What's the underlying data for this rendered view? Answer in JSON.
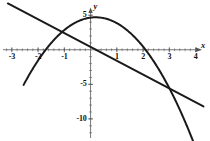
{
  "figure": {
    "kind": "cartesian-plot",
    "background": "#ffffff",
    "stroke_color": "#1a1a1a",
    "axis_color": "#555555"
  },
  "axes": {
    "x_name": "x",
    "y_name": "y",
    "x_range": [
      -3.45,
      4.55
    ],
    "y_range": [
      -13.2,
      7.2
    ],
    "x_major_ticks": [
      -3,
      -2,
      -1,
      1,
      2,
      3,
      4
    ],
    "x_major_labels": [
      "-3",
      "-2",
      "-1",
      "1",
      "2",
      "3",
      "4"
    ],
    "y_major_ticks": [
      5,
      -5,
      -10
    ],
    "y_major_labels": [
      "5",
      "-5",
      "-10"
    ],
    "x_minor_step": 0.2,
    "y_minor_step": 1,
    "grid": false,
    "arrows": [
      "x-right",
      "y-up"
    ]
  },
  "chart_data": {
    "type": "line",
    "title": "",
    "xlabel": "x",
    "ylabel": "y",
    "xlim": [
      -3.45,
      4.55
    ],
    "ylim": [
      -13.2,
      7.2
    ],
    "grid": false,
    "legend": "none",
    "series": [
      {
        "name": "parabola",
        "kind": "quadratic",
        "equation": "y = -1.3x^2 + 0.5x + 4.65",
        "coefficients": {
          "a": -1.3,
          "b": 0.5,
          "c": 4.65
        },
        "vertex": [
          0.19,
          4.7
        ],
        "x_intercepts": [
          -1.71,
          2.1
        ],
        "y_intercept": 4.65,
        "x_domain": [
          -2.55,
          4.25
        ],
        "x": [
          -2.55,
          -2.2,
          -1.85,
          -1.5,
          -1.15,
          -0.8,
          -0.45,
          -0.1,
          0.25,
          0.6,
          0.95,
          1.3,
          1.65,
          2.0,
          2.35,
          2.7,
          3.05,
          3.4,
          3.75,
          4.1,
          4.25
        ],
        "y": [
          -5.08,
          -2.74,
          -0.76,
          0.98,
          2.25,
          3.42,
          3.96,
          4.59,
          4.69,
          4.48,
          3.95,
          3.1,
          1.93,
          0.45,
          -1.36,
          -3.48,
          -5.91,
          -8.68,
          -11.75,
          -15.14,
          -16.69
        ]
      },
      {
        "name": "straight-line",
        "kind": "linear",
        "equation": "y = -2x + 0.4",
        "coefficients": {
          "m": -2,
          "b": 0.4
        },
        "x_intercept": 0.2,
        "y_intercept": 0.4,
        "x_domain": [
          -3.15,
          4.3
        ],
        "x": [
          -3.15,
          4.3
        ],
        "y": [
          6.7,
          -8.2
        ]
      }
    ],
    "intersections": [
      [
        -1.7,
        3.8
      ],
      [
        3.15,
        -5.9
      ]
    ]
  },
  "tick_labels": {
    "x": [
      {
        "text": "-3",
        "value": -3
      },
      {
        "text": "-2",
        "value": -2
      },
      {
        "text": "-1",
        "value": -1
      },
      {
        "text": "1",
        "value": 1
      },
      {
        "text": "2",
        "value": 2
      },
      {
        "text": "3",
        "value": 3
      },
      {
        "text": "4",
        "value": 4
      }
    ],
    "y": [
      {
        "text": "5",
        "value": 5
      },
      {
        "text": "-5",
        "value": -5
      },
      {
        "text": "-10",
        "value": -10
      }
    ]
  }
}
